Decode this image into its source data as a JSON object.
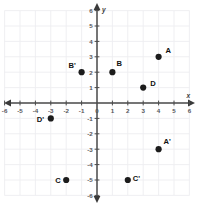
{
  "chart_data": {
    "type": "scatter",
    "title": "",
    "subtitle": "",
    "xlabel": "x",
    "ylabel": "y",
    "xlim": [
      -6,
      6
    ],
    "ylim": [
      -6,
      6
    ],
    "grid": true,
    "legend": null,
    "x_ticks": [
      -6,
      -5,
      -4,
      -3,
      -2,
      -1,
      0,
      1,
      2,
      3,
      4,
      5,
      6
    ],
    "y_ticks": [
      -6,
      -5,
      -4,
      -3,
      -2,
      -1,
      0,
      1,
      2,
      3,
      4,
      5,
      6
    ],
    "x_tick_labels": [
      "-6",
      "-5",
      "-4",
      "-3",
      "-2",
      "-1",
      "0",
      "1",
      "2",
      "3",
      "4",
      "5",
      "6"
    ],
    "y_tick_labels": [
      "-6",
      "-5",
      "-4",
      "-3",
      "-2",
      "-1",
      "",
      "1",
      "2",
      "3",
      "4",
      "5",
      "6"
    ],
    "point_color": "#1c1c1c",
    "grid_color": "#ededf0",
    "axis_color": "#4a4a4a",
    "points": [
      {
        "label": "A",
        "x": 4,
        "y": 3,
        "label_dx": 7,
        "label_dy": -4
      },
      {
        "label": "B",
        "x": 1,
        "y": 2,
        "label_dx": 4,
        "label_dy": -6
      },
      {
        "label": "D",
        "x": 3,
        "y": 1,
        "label_dx": 7,
        "label_dy": -2
      },
      {
        "label": "B'",
        "x": -1,
        "y": 2,
        "label_dx": -13,
        "label_dy": -4
      },
      {
        "label": "D'",
        "x": -3,
        "y": -1,
        "label_dx": -14,
        "label_dy": 4
      },
      {
        "label": "A'",
        "x": 4,
        "y": -3,
        "label_dx": 5,
        "label_dy": -5
      },
      {
        "label": "C",
        "x": -2,
        "y": -5,
        "label_dx": -11,
        "label_dy": 3
      },
      {
        "label": "C'",
        "x": 2,
        "y": -5,
        "label_dx": 5,
        "label_dy": 1
      }
    ]
  },
  "geometry": {
    "width": 199,
    "height": 205,
    "origin_x": 97,
    "origin_y": 103,
    "unit_px": 15.4,
    "dot_radius": 3.1
  }
}
